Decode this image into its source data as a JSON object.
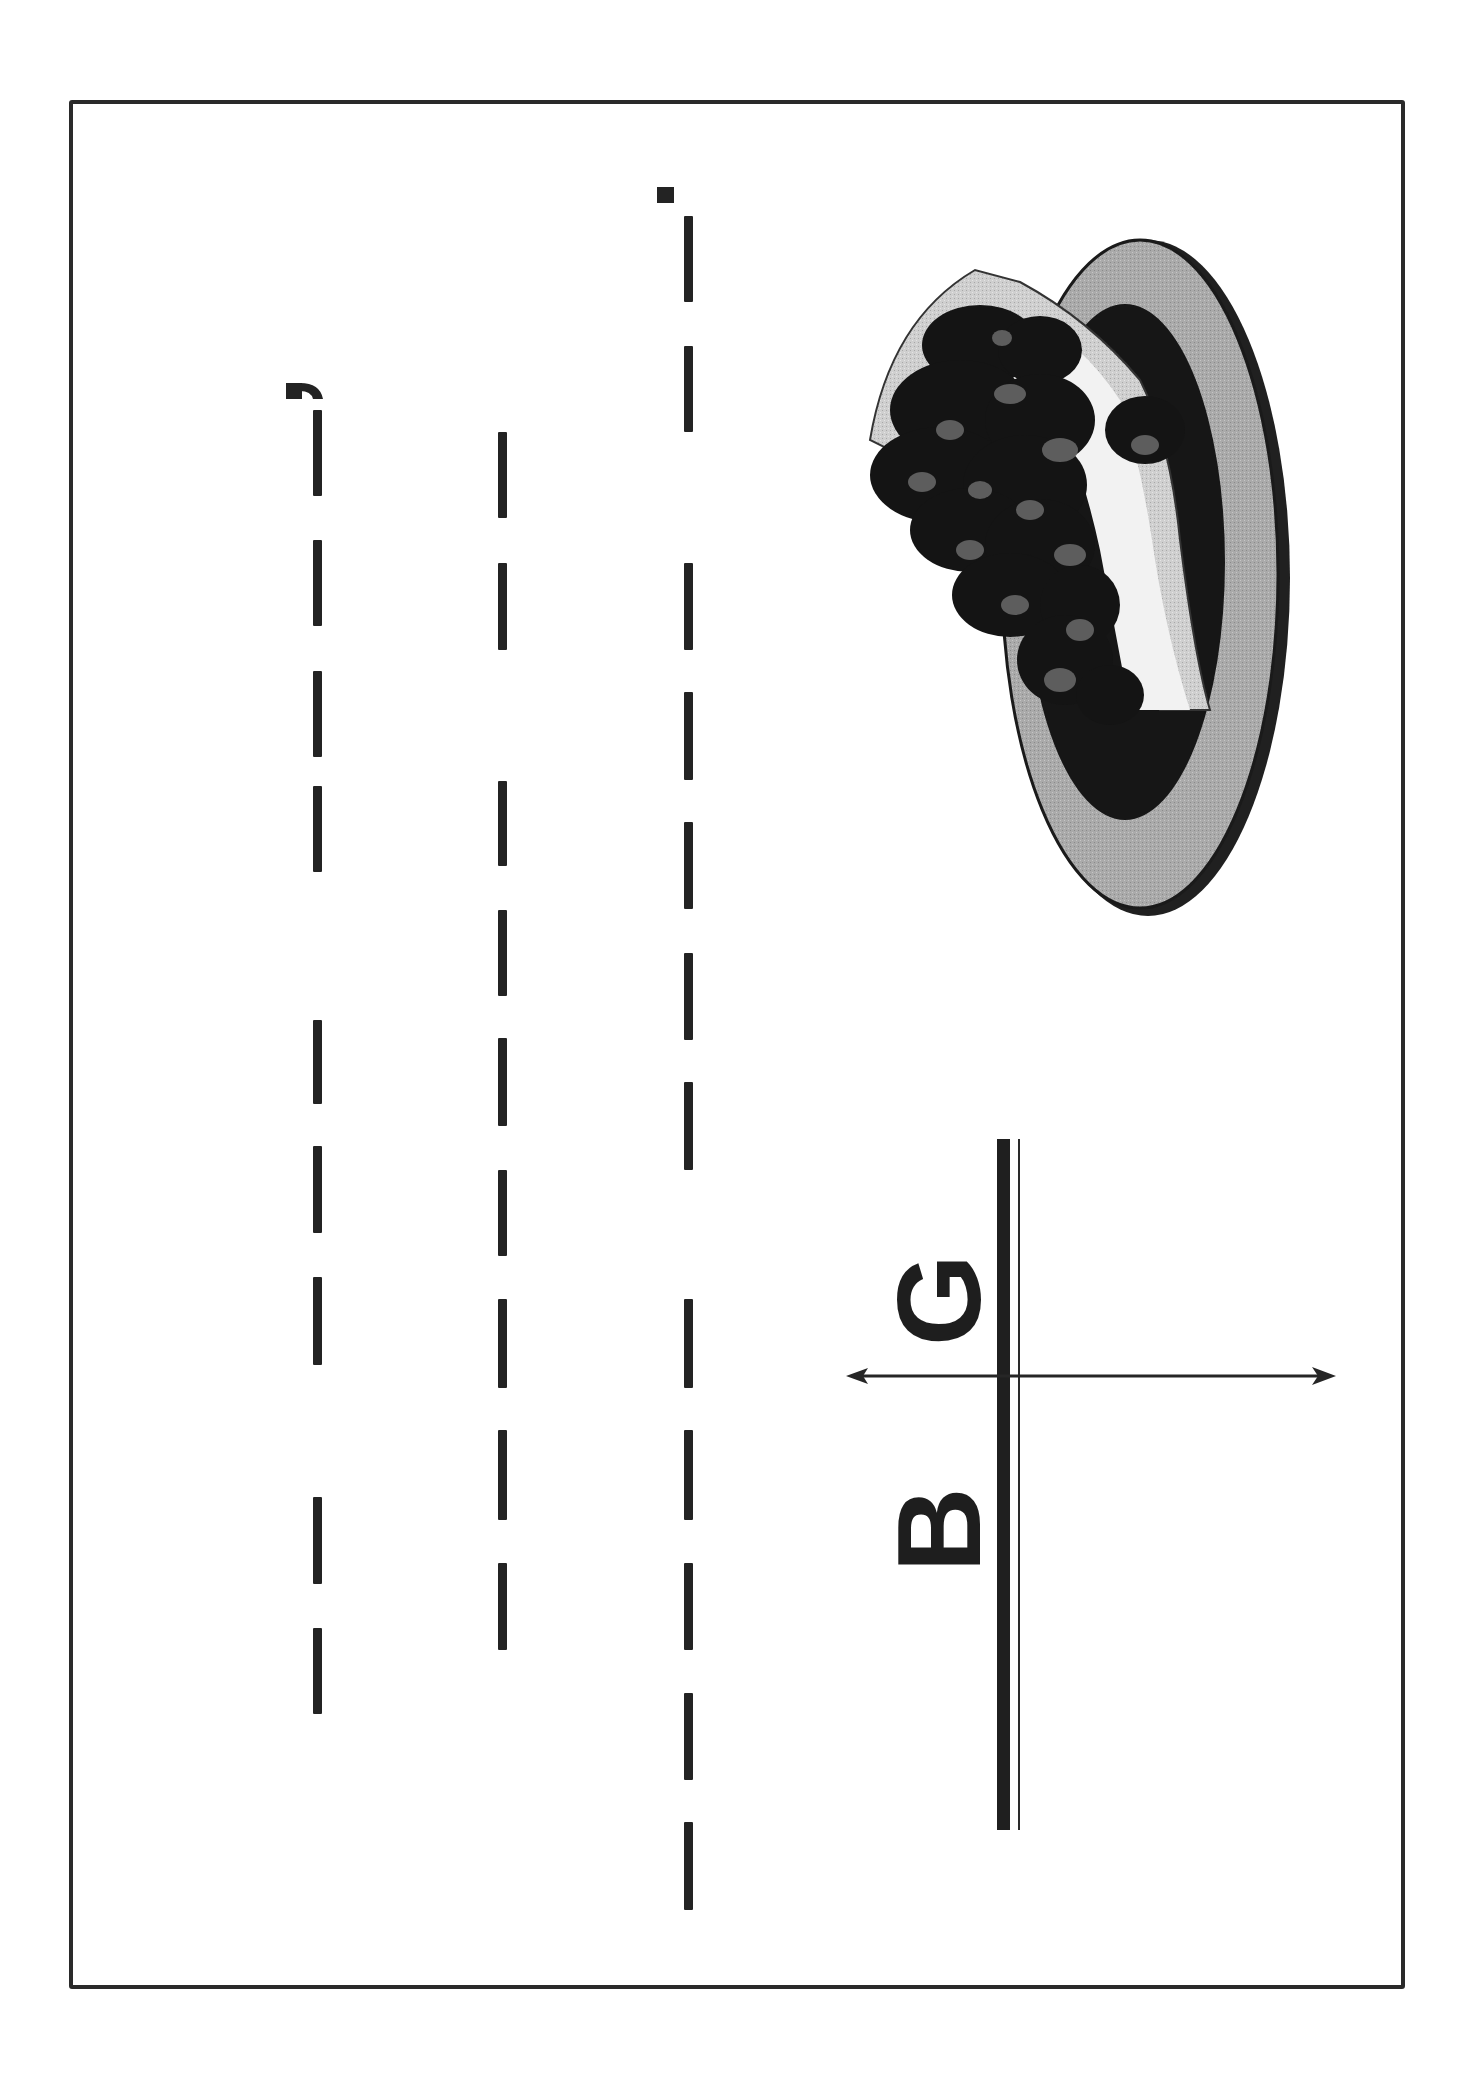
{
  "worksheet": {
    "orientation": "rotated-90-ccw",
    "letters": {
      "first": "B",
      "second": "G"
    },
    "colors": {
      "ink": "#232323",
      "plate_rim": "#a9a9a9",
      "plate_inner": "#1a1a1a",
      "leaf": "#c4c4c4",
      "grapes": "#141414",
      "paper": "#ffffff"
    },
    "illustration": "grapes-on-plate",
    "trace_rows": [
      {
        "name": "row-1-comma",
        "x": 313,
        "end_mark": "comma",
        "dashes": [
          [
            410,
            496
          ],
          [
            540,
            626
          ],
          [
            671,
            757
          ],
          [
            786,
            872
          ],
          [
            1020,
            1104
          ],
          [
            1146,
            1233
          ],
          [
            1277,
            1365
          ],
          [
            1497,
            1584
          ],
          [
            1628,
            1714
          ]
        ]
      },
      {
        "name": "row-2-plain",
        "x": 498,
        "end_mark": "none",
        "dashes": [
          [
            432,
            518
          ],
          [
            563,
            650
          ],
          [
            781,
            866
          ],
          [
            910,
            996
          ],
          [
            1038,
            1126
          ],
          [
            1170,
            1256
          ],
          [
            1299,
            1388
          ],
          [
            1430,
            1520
          ],
          [
            1563,
            1650
          ]
        ]
      },
      {
        "name": "row-3-period",
        "x": 684,
        "end_mark": "period",
        "dashes": [
          [
            216,
            302
          ],
          [
            346,
            432
          ],
          [
            563,
            650
          ],
          [
            692,
            780
          ],
          [
            822,
            909
          ],
          [
            953,
            1040
          ],
          [
            1082,
            1170
          ],
          [
            1299,
            1388
          ],
          [
            1430,
            1520
          ],
          [
            1563,
            1650
          ],
          [
            1693,
            1780
          ],
          [
            1822,
            1910
          ]
        ]
      }
    ]
  }
}
